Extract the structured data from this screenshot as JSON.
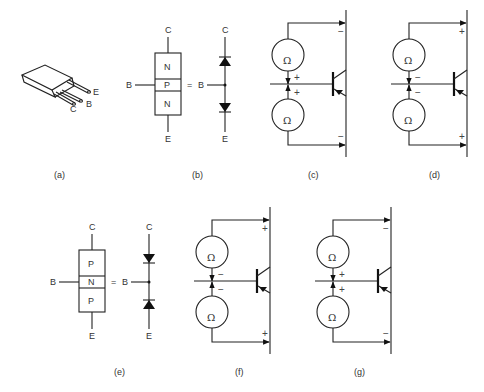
{
  "figure": {
    "panels": [
      {
        "id": "a",
        "caption": "(a)",
        "type": "transistor-package",
        "leads": [
          "C",
          "B",
          "E"
        ]
      },
      {
        "id": "b",
        "caption": "(b)",
        "type": "npn-structure",
        "layers": [
          "N",
          "P",
          "N"
        ],
        "terminals": {
          "top": "C",
          "base": "B",
          "bottom": "E"
        },
        "equals": "=",
        "diode_equivalent": {
          "top": "C",
          "base": "B",
          "bottom": "E"
        }
      },
      {
        "id": "c",
        "caption": "(c)",
        "type": "ohmmeter-test",
        "meter_symbol": "Ω",
        "signs": {
          "collector": "−",
          "base_top": "+",
          "base_bottom": "+",
          "emitter": "−"
        }
      },
      {
        "id": "d",
        "caption": "(d)",
        "type": "ohmmeter-test",
        "meter_symbol": "Ω",
        "signs": {
          "collector": "+",
          "base_top": "−",
          "base_bottom": "−",
          "emitter": "+"
        }
      },
      {
        "id": "e",
        "caption": "(e)",
        "type": "pnp-structure",
        "layers": [
          "P",
          "N",
          "P"
        ],
        "terminals": {
          "top": "C",
          "base": "B",
          "bottom": "E"
        },
        "equals": "=",
        "diode_equivalent": {
          "top": "C",
          "base": "B",
          "bottom": "E"
        }
      },
      {
        "id": "f",
        "caption": "(f)",
        "type": "ohmmeter-test",
        "meter_symbol": "Ω",
        "signs": {
          "collector": "+",
          "base_top": "−",
          "base_bottom": "−",
          "emitter": "+"
        }
      },
      {
        "id": "g",
        "caption": "(g)",
        "type": "ohmmeter-test",
        "meter_symbol": "Ω",
        "signs": {
          "collector": "−",
          "base_top": "+",
          "base_bottom": "+",
          "emitter": "−"
        }
      }
    ]
  }
}
